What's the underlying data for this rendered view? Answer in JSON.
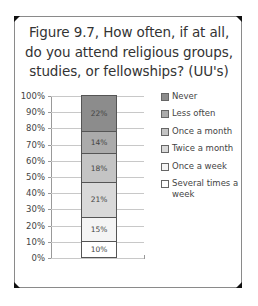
{
  "chart_data": {
    "type": "bar",
    "stacked": true,
    "percent_stacked": true,
    "title": "Figure 9.7, How often, if at all, do you attend religious groups, studies, or fellowships? (UU's)",
    "title_lines": [
      "Figure 9.7, How often, if at all,",
      "do you attend religious groups,",
      "studies, or fellowships? (UU's)"
    ],
    "xlabel": "",
    "ylabel": "",
    "ylim": [
      0,
      100
    ],
    "y_ticks": [
      "0%",
      "10%",
      "20%",
      "30%",
      "40%",
      "50%",
      "60%",
      "70%",
      "80%",
      "90%",
      "100%"
    ],
    "grid": true,
    "legend_position": "right",
    "categories": [
      ""
    ],
    "series": [
      {
        "name": "Several times a week",
        "values": [
          10
        ],
        "label": "10%",
        "color": "#ffffff"
      },
      {
        "name": "Once a week",
        "values": [
          15
        ],
        "label": "15%",
        "color": "#f4f4f4"
      },
      {
        "name": "Twice a month",
        "values": [
          21
        ],
        "label": "21%",
        "color": "#d9d9d9"
      },
      {
        "name": "Once a month",
        "values": [
          18
        ],
        "label": "18%",
        "color": "#c4c4c4"
      },
      {
        "name": "Less often",
        "values": [
          14
        ],
        "label": "14%",
        "color": "#ababab"
      },
      {
        "name": "Never",
        "values": [
          22
        ],
        "label": "22%",
        "color": "#8c8c8c"
      }
    ],
    "legend": [
      {
        "label": "Never",
        "color": "#8c8c8c"
      },
      {
        "label": "Less often",
        "color": "#ababab"
      },
      {
        "label": "Once a month",
        "color": "#c4c4c4"
      },
      {
        "label": "Twice a month",
        "color": "#d9d9d9"
      },
      {
        "label": "Once a week",
        "color": "#f4f4f4"
      },
      {
        "label": "Several times a week",
        "color": "#ffffff"
      }
    ]
  }
}
